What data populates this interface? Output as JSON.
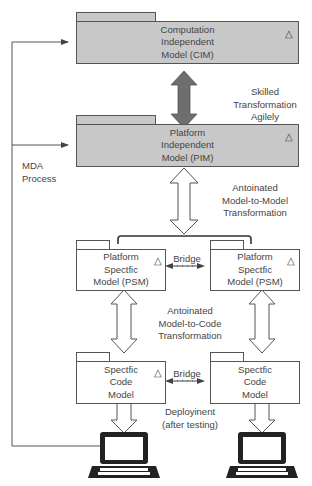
{
  "diagram": {
    "process_label": [
      "MDA",
      "Process"
    ],
    "cim": {
      "lines": [
        "Computation",
        "Independent",
        "Model (CIM)"
      ],
      "fill": "#c8c8c8"
    },
    "pim": {
      "lines": [
        "Platform",
        "Independent",
        "Model (PIM)"
      ],
      "fill": "#c8c8c8"
    },
    "psm_left": {
      "lines": [
        "Platform",
        "Spectfic",
        "Model (PSM)"
      ]
    },
    "psm_right": {
      "lines": [
        "Platform",
        "Spectfic",
        "Model (PSM)"
      ]
    },
    "code_left": {
      "lines": [
        "Spectfic",
        "Code",
        "Model"
      ]
    },
    "code_right": {
      "lines": [
        "Spectfic",
        "Code",
        "Model"
      ]
    },
    "transform_cim_pim": [
      "Skilled",
      "Transformation",
      "Agilely"
    ],
    "transform_m2m": [
      "Antoinated",
      "Model-to-Model",
      "Transformation"
    ],
    "transform_m2c": [
      "Antoinated",
      "Model-to-Code",
      "Transformation"
    ],
    "bridge_psm": "Bridge",
    "bridge_code": "Bridge",
    "deployment": [
      "Deployinent",
      "(after testing)"
    ],
    "triangle_glyph": "△",
    "colors": {
      "box_gray": "#c8c8c8",
      "dark_arrow": "#6e6e6e",
      "line": "#555555"
    }
  }
}
